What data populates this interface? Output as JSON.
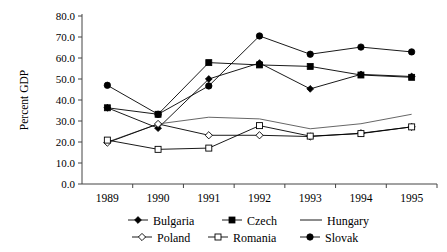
{
  "chart_data": {
    "type": "line",
    "title": "",
    "xlabel": "",
    "ylabel": "Percent GDP",
    "categories": [
      "1989",
      "1990",
      "1991",
      "1992",
      "1993",
      "1994",
      "1995"
    ],
    "x": [
      1989,
      1990,
      1991,
      1992,
      1993,
      1994,
      1995
    ],
    "ylim": [
      0.0,
      80.0
    ],
    "ytick_labels": [
      "0.0",
      "10.0",
      "20.0",
      "30.0",
      "40.0",
      "50.0",
      "60.0",
      "70.0",
      "80.0"
    ],
    "ytick_values": [
      0,
      10,
      20,
      30,
      40,
      50,
      60,
      70,
      80
    ],
    "grid": false,
    "legend_position": "bottom",
    "series": [
      {
        "name": "Bulgaria",
        "marker": "filled-diamond",
        "color": "#000000",
        "values": [
          36.3,
          26.6,
          50.0,
          57.6,
          45.3,
          52.2,
          51.2
        ]
      },
      {
        "name": "Czech",
        "marker": "filled-square",
        "color": "#000000",
        "values": [
          36.3,
          33.2,
          57.8,
          56.7,
          56.0,
          51.9,
          50.8
        ]
      },
      {
        "name": "Hungary",
        "marker": "none",
        "color": "#555555",
        "values": [
          20.0,
          28.6,
          31.8,
          31.0,
          26.3,
          28.7,
          33.2
        ]
      },
      {
        "name": "Poland",
        "marker": "open-diamond",
        "color": "#000000",
        "values": [
          19.7,
          28.6,
          23.2,
          23.2,
          22.6,
          24.2,
          27.2
        ]
      },
      {
        "name": "Romania",
        "marker": "open-square",
        "color": "#000000",
        "values": [
          20.9,
          16.5,
          17.1,
          27.8,
          22.8,
          24.0,
          27.2
        ]
      },
      {
        "name": "Slovak",
        "marker": "filled-circle",
        "color": "#000000",
        "values": [
          47.0,
          33.2,
          46.7,
          70.5,
          61.8,
          65.2,
          62.9
        ]
      }
    ]
  },
  "axis": {
    "y_title": "Percent GDP"
  },
  "legend": {
    "rows": [
      [
        {
          "label": "Bulgaria",
          "marker": "filled-diamond"
        },
        {
          "label": "Czech",
          "marker": "filled-square"
        },
        {
          "label": "Hungary",
          "marker": "line"
        }
      ],
      [
        {
          "label": "Poland",
          "marker": "open-diamond"
        },
        {
          "label": "Romania",
          "marker": "open-square"
        },
        {
          "label": "Slovak",
          "marker": "filled-circle"
        }
      ]
    ]
  }
}
